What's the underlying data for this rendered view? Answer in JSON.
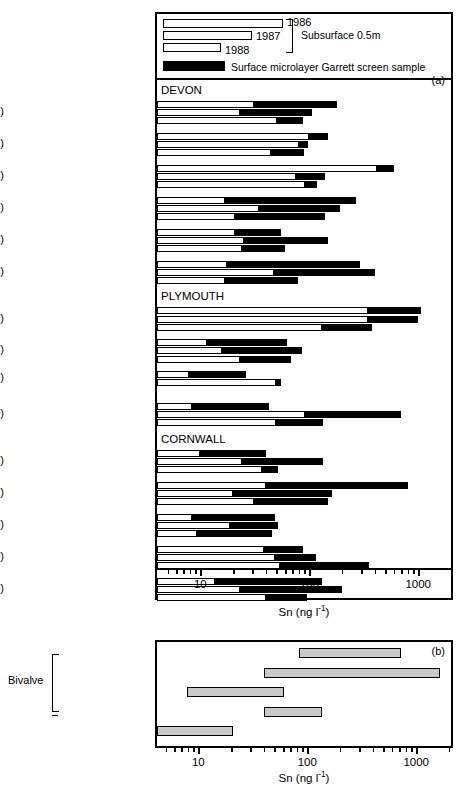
{
  "chart_data": [
    {
      "type": "bar",
      "panel": "a",
      "panel_label": "(a)",
      "xlabel": "Sn (ng l-1)",
      "xlabel_html": "Sn (ng l<sup>-1</sup>)",
      "xscale": "log",
      "xlim": [
        4,
        2000
      ],
      "xticks": [
        10,
        100,
        1000
      ],
      "xticklabels": [
        "10",
        "100",
        "1000"
      ],
      "grid": false,
      "legend": {
        "years": [
          "1986",
          "1987",
          "1988"
        ],
        "subsurface_label": "Subsurface 0.5m",
        "microlayer_label": "Surface microlayer Garrett screen sample",
        "subsurface_fill": "#ffffff",
        "microlayer_fill": "#000000"
      },
      "series_note": "Each site shows three bars (top=1986, middle=1987, bottom=1988). White segment = subsurface 0.5 m value; black segment extends to the surface microlayer value.",
      "regions": [
        "DEVON",
        "PLYMOUTH",
        "CORNWALL"
      ],
      "sites": [
        {
          "label": "Starcross (1)",
          "region": "DEVON",
          "bars": [
            {
              "year": "1986",
              "subsurface": 30,
              "microlayer": 180
            },
            {
              "year": "1987",
              "subsurface": 22,
              "microlayer": 105
            },
            {
              "year": "1988",
              "subsurface": 48,
              "microlayer": 88
            }
          ]
        },
        {
          "label": "Torquay Harbour (2)",
          "region": "DEVON",
          "bars": [
            {
              "year": "1986",
              "subsurface": 95,
              "microlayer": 150
            },
            {
              "year": "1987",
              "subsurface": 77,
              "microlayer": 97
            },
            {
              "year": "1988",
              "subsurface": 43,
              "microlayer": 90
            }
          ]
        },
        {
          "label": "Torquay Marina (3)",
          "region": "DEVON",
          "bars": [
            {
              "year": "1986",
              "subsurface": 400,
              "microlayer": 600
            },
            {
              "year": "1987",
              "subsurface": 72,
              "microlayer": 140
            },
            {
              "year": "1988",
              "subsurface": 88,
              "microlayer": 118
            }
          ]
        },
        {
          "label": "Dartmouth Marina (4)",
          "region": "DEVON",
          "bars": [
            {
              "year": "1986",
              "subsurface": 16,
              "microlayer": 270
            },
            {
              "year": "1987",
              "subsurface": 33,
              "microlayer": 190
            },
            {
              "year": "1988",
              "subsurface": 20,
              "microlayer": 140
            }
          ]
        },
        {
          "label": "River Dart (5)",
          "region": "DEVON",
          "bars": [
            {
              "year": "1986",
              "subsurface": 20,
              "microlayer": 55
            },
            {
              "year": "1987",
              "subsurface": 24,
              "microlayer": 150
            },
            {
              "year": "1988",
              "subsurface": 23,
              "microlayer": 60
            }
          ]
        },
        {
          "label": "River Yealm (6)",
          "region": "DEVON",
          "bars": [
            {
              "year": "1986",
              "subsurface": 17,
              "microlayer": 290
            },
            {
              "year": "1987",
              "subsurface": 45,
              "microlayer": 400
            },
            {
              "year": "1988",
              "subsurface": 16,
              "microlayer": 78
            }
          ]
        },
        {
          "label": "Sutton Marina (7)",
          "region": "PLYMOUTH",
          "bars": [
            {
              "year": "1986",
              "subsurface": 330,
              "microlayer": 1050
            },
            {
              "year": "1987",
              "subsurface": 330,
              "microlayer": 1000
            },
            {
              "year": "1988",
              "subsurface": 125,
              "microlayer": 380
            }
          ]
        },
        {
          "label": "Plymouth Hoe (8)",
          "region": "PLYMOUTH",
          "bars": [
            {
              "year": "1986",
              "subsurface": 11,
              "microlayer": 62
            },
            {
              "year": "1987",
              "subsurface": 15,
              "microlayer": 85
            },
            {
              "year": "1988",
              "subsurface": 22,
              "microlayer": 68
            }
          ]
        },
        {
          "label": "Millbay Docks (9)",
          "region": "PLYMOUTH",
          "bars": [
            {
              "year": "1986",
              "subsurface": 7.5,
              "microlayer": 26
            },
            {
              "year": "1988",
              "subsurface": 47,
              "microlayer": 55
            }
          ]
        },
        {
          "label": "Ocean Court Marina (10)",
          "region": "PLYMOUTH",
          "bars": [
            {
              "year": "1986",
              "subsurface": 8,
              "microlayer": 43
            },
            {
              "year": "1987",
              "subsurface": 88,
              "microlayer": 700
            },
            {
              "year": "1988",
              "subsurface": 47,
              "microlayer": 135
            }
          ]
        },
        {
          "label": "Saltash (11)",
          "region": "CORNWALL",
          "bars": [
            {
              "year": "1986",
              "subsurface": 9.5,
              "microlayer": 40
            },
            {
              "year": "1987",
              "subsurface": 23,
              "microlayer": 135
            },
            {
              "year": "1988",
              "subsurface": 35,
              "microlayer": 52
            }
          ]
        },
        {
          "label": "Looe (12)",
          "region": "CORNWALL",
          "bars": [
            {
              "year": "1986",
              "subsurface": 38,
              "microlayer": 800
            },
            {
              "year": "1987",
              "subsurface": 19,
              "microlayer": 160
            },
            {
              "year": "1988",
              "subsurface": 30,
              "microlayer": 150
            }
          ]
        },
        {
          "label": "King Harry Ferry (13)",
          "region": "CORNWALL",
          "bars": [
            {
              "year": "1986",
              "subsurface": 8,
              "microlayer": 48
            },
            {
              "year": "1987",
              "subsurface": 18,
              "microlayer": 52
            },
            {
              "year": "1988",
              "subsurface": 9,
              "microlayer": 45
            }
          ]
        },
        {
          "label": "Falmouth Pier (14)",
          "region": "CORNWALL",
          "bars": [
            {
              "year": "1986",
              "subsurface": 37,
              "microlayer": 88
            },
            {
              "year": "1987",
              "subsurface": 46,
              "microlayer": 115
            },
            {
              "year": "1988",
              "subsurface": 52,
              "microlayer": 350
            }
          ]
        },
        {
          "label": "Porth Navas (15)",
          "region": "CORNWALL",
          "bars": [
            {
              "year": "1986",
              "subsurface": 13,
              "microlayer": 130
            },
            {
              "year": "1987",
              "subsurface": 22,
              "microlayer": 200
            },
            {
              "year": "1988",
              "subsurface": 38,
              "microlayer": 95
            }
          ]
        }
      ]
    },
    {
      "type": "bar",
      "panel": "b",
      "panel_label": "(b)",
      "xlabel": "Sn (ng l-1)",
      "xlabel_html": "Sn (ng l<sup>-1</sup>)",
      "xscale": "log",
      "xlim": [
        4,
        2000
      ],
      "xticks": [
        10,
        100,
        1000
      ],
      "xticklabels": [
        "10",
        "100",
        "1000"
      ],
      "grid": false,
      "group_label": "Bivalve",
      "bar_fill": "#c9c9c9",
      "effects": [
        {
          "label": "adult mortality",
          "group": "Bivalve",
          "low": 80,
          "high": 700
        },
        {
          "label": "larval mortality",
          "group": "Bivalve",
          "low": 38,
          "high": 1600
        },
        {
          "label": "growth inhibition",
          "group": "Bivalve",
          "low": 7.5,
          "high": 58
        },
        {
          "label": "Hydroid - stress responce",
          "group": null,
          "low": 38,
          "high": 130
        },
        {
          "label": "Gastropod - imposex induced",
          "group": null,
          "low": 4,
          "high": 20
        }
      ]
    }
  ]
}
